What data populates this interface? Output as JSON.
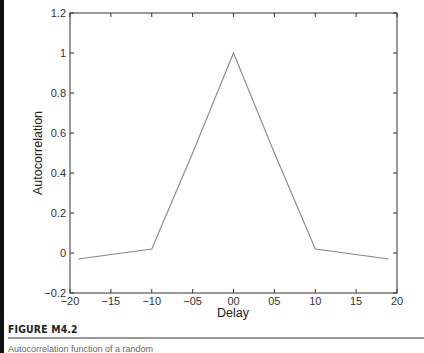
{
  "figure": {
    "label": "FIGURE M4.2",
    "caption": "Autocorrelation function of a random"
  },
  "chart_data": {
    "type": "line",
    "title": "",
    "xlabel": "Delay",
    "ylabel": "Autocorrelation",
    "xlim": [
      -20,
      20
    ],
    "ylim": [
      -0.2,
      1.2
    ],
    "xticks": [
      -20,
      -15,
      -10,
      -5,
      0,
      5,
      10,
      15,
      20
    ],
    "xtick_labels": [
      "-20",
      "-15",
      "-10",
      "-05",
      "00",
      "05",
      "10",
      "15",
      "20"
    ],
    "yticks": [
      -0.2,
      0,
      0.2,
      0.4,
      0.6,
      0.8,
      1,
      1.2
    ],
    "ytick_labels": [
      "-0.2",
      "0",
      "0.2",
      "0.4",
      "0.6",
      "0.8",
      "1",
      "1.2"
    ],
    "grid": false,
    "legend": null,
    "series": [
      {
        "name": "autocorrelation",
        "color": "#888888",
        "x": [
          -19,
          -10,
          -5,
          0,
          5,
          10,
          19
        ],
        "y": [
          -0.03,
          0.02,
          0.5,
          1.0,
          0.5,
          0.02,
          -0.03
        ]
      }
    ]
  }
}
